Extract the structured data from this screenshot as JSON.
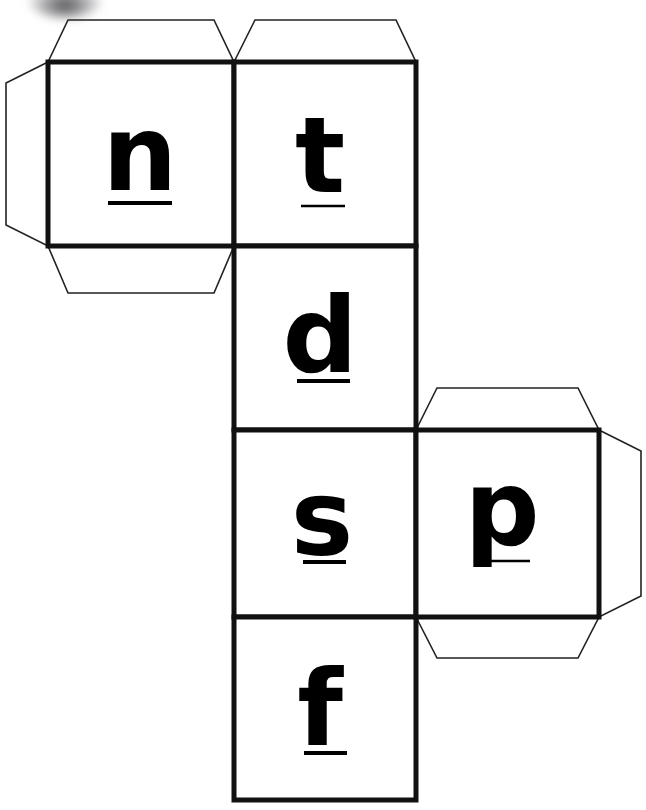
{
  "document": {
    "title": "Cube net with lowercase letters",
    "background_color": "#ffffff",
    "line_color": "#111111",
    "flap_line_color": "#222222",
    "glyph_color": "#000000",
    "width": 646,
    "height": 810
  },
  "artifact": {
    "name": "scan-smudge",
    "description": "blurred dark scanner smudge at top-left",
    "color": "#28282c"
  },
  "net": {
    "cell_size": 183,
    "column_x": [
      48,
      234,
      416,
      599
    ],
    "row_y": [
      62,
      246,
      430,
      617,
      800
    ],
    "faces": [
      {
        "id": "face-n",
        "letter": "n",
        "underline": "below",
        "grid": {
          "col": 0,
          "row": 0
        },
        "x": 48,
        "y": 62,
        "w": 186,
        "h": 184,
        "glyph_cx": 140,
        "glyph_baseline": 190,
        "rule_x1": 108,
        "rule_x2": 172,
        "rule_y": 203,
        "flaps": [
          "top",
          "left",
          "bottom"
        ]
      },
      {
        "id": "face-t",
        "letter": "t",
        "underline": "below",
        "grid": {
          "col": 1,
          "row": 0
        },
        "x": 234,
        "y": 62,
        "w": 182,
        "h": 184,
        "glyph_cx": 320,
        "glyph_baseline": 192,
        "rule_x1": 301,
        "rule_x2": 345,
        "rule_y": 206,
        "flaps": [
          "top"
        ]
      },
      {
        "id": "face-d",
        "letter": "d",
        "underline": "below",
        "grid": {
          "col": 1,
          "row": 1
        },
        "x": 234,
        "y": 246,
        "w": 182,
        "h": 184,
        "glyph_cx": 320,
        "glyph_baseline": 372,
        "rule_x1": 297,
        "rule_x2": 350,
        "rule_y": 381,
        "flaps": []
      },
      {
        "id": "face-s",
        "letter": "s",
        "underline": "below",
        "grid": {
          "col": 1,
          "row": 2
        },
        "x": 234,
        "y": 430,
        "w": 182,
        "h": 187,
        "glyph_cx": 322,
        "glyph_baseline": 555,
        "rule_x1": 303,
        "rule_x2": 346,
        "rule_y": 562,
        "flaps": []
      },
      {
        "id": "face-f",
        "letter": "f",
        "underline": "below",
        "grid": {
          "col": 1,
          "row": 3
        },
        "x": 234,
        "y": 617,
        "w": 182,
        "h": 183,
        "glyph_cx": 320,
        "glyph_baseline": 745,
        "rule_x1": 304,
        "rule_x2": 347,
        "rule_y": 753,
        "flaps": []
      },
      {
        "id": "face-p",
        "letter": "p",
        "underline": "baseline-crossing",
        "grid": {
          "col": 2,
          "row": 2
        },
        "x": 416,
        "y": 430,
        "w": 183,
        "h": 187,
        "glyph_cx": 502,
        "glyph_baseline": 545,
        "rule_x1": 484,
        "rule_x2": 530,
        "rule_y": 561,
        "flaps": [
          "top",
          "right",
          "bottom"
        ]
      }
    ],
    "flaps": [
      {
        "id": "flap-n-top",
        "points": "48,62 68,20 214,20 234,62"
      },
      {
        "id": "flap-n-left",
        "points": "48,62 6,83 6,225 48,246"
      },
      {
        "id": "flap-n-bottom",
        "points": "48,246 68,293 214,293 234,246"
      },
      {
        "id": "flap-t-top",
        "points": "234,62 255,20 396,20 416,62"
      },
      {
        "id": "flap-p-top",
        "points": "416,430 437,388 578,388 599,430"
      },
      {
        "id": "flap-p-right",
        "points": "599,430 641,451 641,596 599,617"
      },
      {
        "id": "flap-p-bottom",
        "points": "416,617 437,658 578,658 599,617"
      }
    ]
  }
}
